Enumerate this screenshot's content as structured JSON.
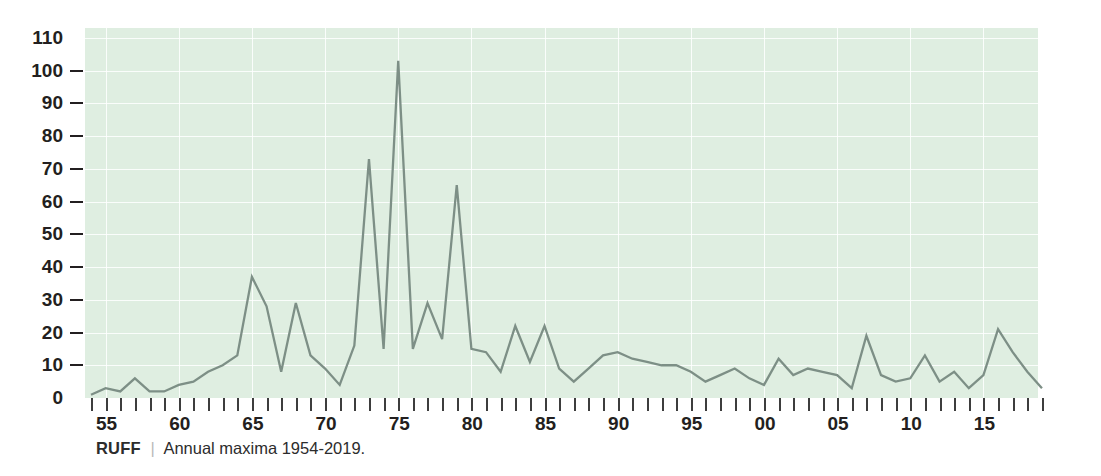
{
  "caption": {
    "name": "RUFF",
    "separator": "|",
    "text": "Annual maxima 1954-2019."
  },
  "axes": {
    "y_ticks": [
      "110",
      "100",
      "90",
      "80",
      "70",
      "60",
      "50",
      "40",
      "30",
      "20",
      "10",
      "0"
    ],
    "x_tick_labels": [
      "55",
      "60",
      "65",
      "70",
      "75",
      "80",
      "85",
      "90",
      "95",
      "00",
      "05",
      "10",
      "15"
    ],
    "x_label_years": [
      1955,
      1960,
      1965,
      1970,
      1975,
      1980,
      1985,
      1990,
      1995,
      2000,
      2005,
      2010,
      2015
    ]
  },
  "colors": {
    "plot_background": "#dfeee1",
    "gridline": "#ffffff",
    "series_line": "#7d8f86",
    "text": "#231f20",
    "caption_separator": "#b9b9b9"
  },
  "chart_data": {
    "type": "line",
    "title": "",
    "subtitle": "",
    "xlabel": "",
    "ylabel": "",
    "xlim": [
      1954,
      2019
    ],
    "ylim": [
      0,
      113
    ],
    "y_tick_step": 10,
    "grid": true,
    "legend_position": "none",
    "series_name": "RUFF annual maxima",
    "x": [
      1954,
      1955,
      1956,
      1957,
      1958,
      1959,
      1960,
      1961,
      1962,
      1963,
      1964,
      1965,
      1966,
      1967,
      1968,
      1969,
      1970,
      1971,
      1972,
      1973,
      1974,
      1975,
      1976,
      1977,
      1978,
      1979,
      1980,
      1981,
      1982,
      1983,
      1984,
      1985,
      1986,
      1987,
      1988,
      1989,
      1990,
      1991,
      1992,
      1993,
      1994,
      1995,
      1996,
      1997,
      1998,
      1999,
      2000,
      2001,
      2002,
      2003,
      2004,
      2005,
      2006,
      2007,
      2008,
      2009,
      2010,
      2011,
      2012,
      2013,
      2014,
      2015,
      2016,
      2017,
      2018,
      2019
    ],
    "values": [
      1,
      3,
      2,
      6,
      2,
      2,
      4,
      5,
      8,
      10,
      13,
      37,
      28,
      8,
      29,
      13,
      9,
      4,
      16,
      73,
      15,
      103,
      15,
      29,
      18,
      65,
      15,
      14,
      8,
      22,
      11,
      22,
      9,
      5,
      9,
      13,
      14,
      12,
      11,
      10,
      10,
      8,
      5,
      7,
      9,
      6,
      4,
      12,
      7,
      9,
      8,
      7,
      3,
      19,
      7,
      5,
      6,
      13,
      5,
      8,
      3,
      7,
      21,
      14,
      8,
      3
    ]
  }
}
